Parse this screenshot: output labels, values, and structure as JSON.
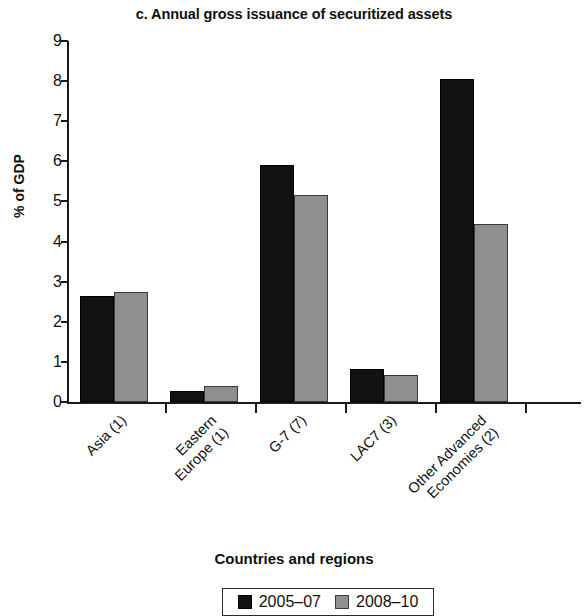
{
  "chart_data": {
    "type": "bar",
    "title": "c. Annual gross issuance of securitized assets",
    "xlabel": "Countries and regions",
    "ylabel": "% of GDP",
    "ylim": [
      0,
      9
    ],
    "yticks": [
      0,
      1,
      2,
      3,
      4,
      5,
      6,
      7,
      8,
      9
    ],
    "ytick_labels": [
      "0",
      "1",
      "2",
      "3",
      "4",
      "5",
      "6",
      "7",
      "8",
      "9"
    ],
    "grid": false,
    "legend_position": "bottom-center",
    "categories": [
      "Asia (1)",
      "Eastern Europe (1)",
      "G-7 (7)",
      "LAC7 (3)",
      "Other Advanced Economies (2)"
    ],
    "category_lines": [
      [
        "Asia (1)"
      ],
      [
        "Eastern",
        "Europe (1)"
      ],
      [
        "G-7 (7)"
      ],
      [
        "LAC7 (3)"
      ],
      [
        "Other Advanced",
        "Economies (2)"
      ]
    ],
    "series": [
      {
        "name": "2005–07",
        "color": "#121212",
        "values": [
          2.65,
          0.28,
          5.9,
          0.82,
          8.05
        ]
      },
      {
        "name": "2008–10",
        "color": "#8f8f8f",
        "values": [
          2.75,
          0.4,
          5.15,
          0.67,
          4.45
        ]
      }
    ]
  },
  "legend": {
    "entries": [
      {
        "label": "2005–07",
        "swatch": "black-square-swatch"
      },
      {
        "label": "2008–10",
        "swatch": "gray-square-swatch"
      }
    ]
  }
}
